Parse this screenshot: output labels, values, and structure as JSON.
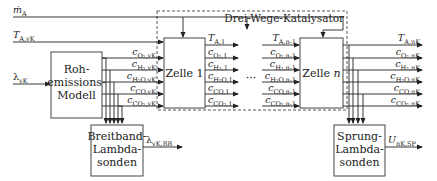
{
  "diagram": {
    "title": "Drei-Wege-Katalysator",
    "inputs": {
      "mass_flow": {
        "main": "ṁ",
        "sub": "A"
      },
      "temperature": {
        "main": "T",
        "sub": "A,vK"
      },
      "lambda": {
        "main": "λ",
        "sub": "vK"
      }
    },
    "blocks": {
      "raw_emissions": {
        "line1": "Roh-",
        "line2": "emissions-",
        "line3": "Modell"
      },
      "cell_1": {
        "label": "Zelle 1"
      },
      "cell_n": {
        "label": "Zelle ",
        "label_var": "n"
      },
      "wideband": {
        "line1": "Breitband-",
        "line2": "Lambda-",
        "line3": "sonden"
      },
      "binary": {
        "line1": "Sprung-",
        "line2": "Lambda-",
        "line3": "sonden"
      }
    },
    "ellipsis": "···",
    "signals_vK": [
      {
        "main": "c",
        "sub": "O₂,vK"
      },
      {
        "main": "c",
        "sub": "H₂,vK"
      },
      {
        "main": "c",
        "sub": "H₂O,vK"
      },
      {
        "main": "c",
        "sub": "CO,vK"
      },
      {
        "main": "c",
        "sub": "CO₂,vK"
      }
    ],
    "signals_1": [
      {
        "main": "T",
        "sub": "A,1"
      },
      {
        "main": "c",
        "sub": "O₂,1"
      },
      {
        "main": "c",
        "sub": "H₂,1"
      },
      {
        "main": "c",
        "sub": "H₂O,1"
      },
      {
        "main": "c",
        "sub": "CO,1"
      },
      {
        "main": "c",
        "sub": "CO₂,1"
      }
    ],
    "signals_n_minus_1": [
      {
        "main": "T",
        "sub": "A,n-1"
      },
      {
        "main": "c",
        "sub": "O₂,n-1"
      },
      {
        "main": "c",
        "sub": "H₂,n-1"
      },
      {
        "main": "c",
        "sub": "H₂O,n-1"
      },
      {
        "main": "c",
        "sub": "CO,n-1"
      },
      {
        "main": "c",
        "sub": "CO₂,n-1"
      }
    ],
    "signals_nK": [
      {
        "main": "T",
        "sub": "A,nK"
      },
      {
        "main": "c",
        "sub": "O₂,nK"
      },
      {
        "main": "c",
        "sub": "H₂,nK"
      },
      {
        "main": "c",
        "sub": "H₂O,nK"
      },
      {
        "main": "c",
        "sub": "CO,nK"
      },
      {
        "main": "c",
        "sub": "CO₂,nK"
      }
    ],
    "outputs": {
      "wideband": {
        "main": "λ",
        "sub": "vK,BR"
      },
      "binary": {
        "main": "U",
        "sub": "nK,SP"
      }
    }
  }
}
